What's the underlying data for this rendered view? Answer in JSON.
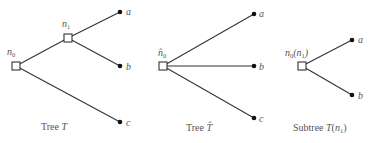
{
  "diagram": {
    "type": "tree-comparison",
    "colors": {
      "edge": "#333333",
      "node_stroke": "#333333",
      "leaf": "#111111",
      "text": "#555555"
    },
    "trees": [
      {
        "id": "tree-T",
        "caption_prefix": "Tree ",
        "caption_symbol": "T",
        "internal_nodes": [
          {
            "id": "n0",
            "label_base": "n",
            "label_sub": "0",
            "hat": false
          },
          {
            "id": "n1",
            "label_base": "n",
            "label_sub": "1",
            "hat": false
          }
        ],
        "leaves": [
          {
            "id": "a",
            "label": "a"
          },
          {
            "id": "b",
            "label": "b"
          },
          {
            "id": "c",
            "label": "c"
          }
        ],
        "edges": [
          [
            "n0",
            "n1"
          ],
          [
            "n1",
            "a"
          ],
          [
            "n1",
            "b"
          ],
          [
            "n0",
            "c"
          ]
        ]
      },
      {
        "id": "tree-T-hat",
        "caption_prefix": "Tree ",
        "caption_symbol": "T̂",
        "internal_nodes": [
          {
            "id": "n0hat",
            "label_base": "n̂",
            "label_sub": "0",
            "hat": true
          }
        ],
        "leaves": [
          {
            "id": "a",
            "label": "a"
          },
          {
            "id": "b",
            "label": "b"
          },
          {
            "id": "c",
            "label": "c"
          }
        ],
        "edges": [
          [
            "n0hat",
            "a"
          ],
          [
            "n0hat",
            "b"
          ],
          [
            "n0hat",
            "c"
          ]
        ]
      },
      {
        "id": "subtree-T-n1",
        "caption_prefix": "Subtree ",
        "caption_symbol": "T",
        "caption_arg_base": "n",
        "caption_arg_sub": "1",
        "internal_nodes": [
          {
            "id": "n0_of_n1",
            "label_base": "n",
            "label_sub": "0",
            "label_arg_base": "n",
            "label_arg_sub": "1"
          }
        ],
        "leaves": [
          {
            "id": "a",
            "label": "a"
          },
          {
            "id": "b",
            "label": "b"
          }
        ],
        "edges": [
          [
            "n0_of_n1",
            "a"
          ],
          [
            "n0_of_n1",
            "b"
          ]
        ]
      }
    ]
  }
}
